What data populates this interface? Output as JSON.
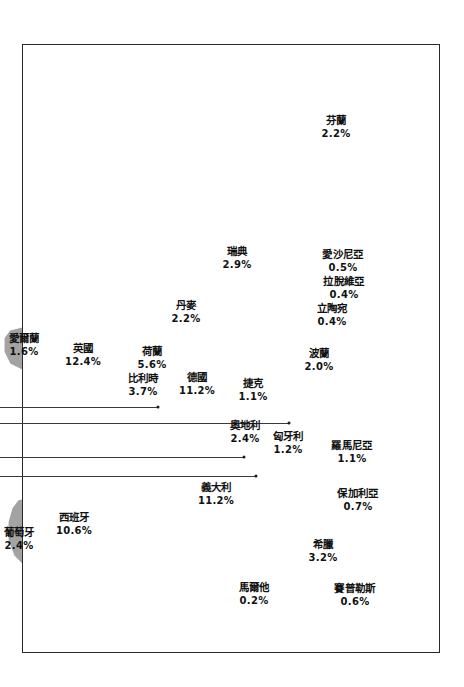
{
  "figure": {
    "type": "choropleth-map",
    "region": "Europe",
    "land_color": "#a3a3a3",
    "border_color": "#ffffff",
    "sea_color": "#ffffff",
    "frame_color": "#2a2a2a",
    "label_color": "#111111",
    "leader_color": "#3a3a3a"
  },
  "chart_data": {
    "type": "map",
    "title": "",
    "subtitle": "",
    "xlabel": "",
    "ylabel": "",
    "unit": "%",
    "legend": [],
    "grid": false,
    "categories": [
      "芬蘭",
      "瑞典",
      "丹麥",
      "愛沙尼亞",
      "拉脫維亞",
      "立陶宛",
      "愛爾蘭",
      "英國",
      "荷蘭",
      "比利時",
      "德國",
      "波蘭",
      "捷克",
      "奧地利",
      "匈牙利",
      "羅馬尼亞",
      "義大利",
      "保加利亞",
      "西班牙",
      "葡萄牙",
      "希臘",
      "馬爾他",
      "賽普勒斯"
    ],
    "values": [
      2.2,
      2.9,
      2.2,
      0.5,
      0.4,
      0.4,
      1.6,
      12.4,
      5.6,
      3.7,
      11.2,
      2.0,
      1.1,
      2.4,
      1.2,
      1.1,
      11.2,
      0.7,
      10.6,
      2.4,
      3.2,
      0.2,
      0.6
    ]
  },
  "labels": [
    {
      "name": "芬蘭",
      "value": "2.2%",
      "key": "finland",
      "x": 336,
      "y": 127
    },
    {
      "name": "瑞典",
      "value": "2.9%",
      "key": "sweden",
      "x": 237,
      "y": 258
    },
    {
      "name": "丹麥",
      "value": "2.2%",
      "key": "denmark",
      "x": 186,
      "y": 312
    },
    {
      "name": "愛沙尼亞",
      "value": "0.5%",
      "key": "estonia",
      "x": 343,
      "y": 261
    },
    {
      "name": "拉脫維亞",
      "value": "0.4%",
      "key": "latvia",
      "x": 344,
      "y": 288
    },
    {
      "name": "立陶宛",
      "value": "0.4%",
      "key": "lithuania",
      "x": 332,
      "y": 315
    },
    {
      "name": "愛爾蘭",
      "value": "1.6%",
      "key": "ireland",
      "x": 24,
      "y": 345
    },
    {
      "name": "英國",
      "value": "12.4%",
      "key": "united-kingdom",
      "x": 83,
      "y": 355
    },
    {
      "name": "荷蘭",
      "value": "5.6%",
      "key": "netherlands",
      "x": 152,
      "y": 358
    },
    {
      "name": "比利時",
      "value": "3.7%",
      "key": "belgium",
      "x": 143,
      "y": 385
    },
    {
      "name": "德國",
      "value": "11.2%",
      "key": "germany",
      "x": 197,
      "y": 384
    },
    {
      "name": "波蘭",
      "value": "2.0%",
      "key": "poland",
      "x": 319,
      "y": 360
    },
    {
      "name": "捷克",
      "value": "1.1%",
      "key": "czechia",
      "x": 253,
      "y": 390
    },
    {
      "name": "奧地利",
      "value": "2.4%",
      "key": "austria",
      "x": 245,
      "y": 432
    },
    {
      "name": "匈牙利",
      "value": "1.2%",
      "key": "hungary",
      "x": 288,
      "y": 443
    },
    {
      "name": "羅馬尼亞",
      "value": "1.1%",
      "key": "romania",
      "x": 352,
      "y": 452
    },
    {
      "name": "義大利",
      "value": "11.2%",
      "key": "italy",
      "x": 216,
      "y": 494
    },
    {
      "name": "保加利亞",
      "value": "0.7%",
      "key": "bulgaria",
      "x": 358,
      "y": 500
    },
    {
      "name": "西班牙",
      "value": "10.6%",
      "key": "spain",
      "x": 74,
      "y": 524
    },
    {
      "name": "葡萄牙",
      "value": "2.4%",
      "key": "portugal",
      "x": 19,
      "y": 539
    },
    {
      "name": "希臘",
      "value": "3.2%",
      "key": "greece",
      "x": 323,
      "y": 551
    },
    {
      "name": "馬爾他",
      "value": "0.2%",
      "key": "malta",
      "x": 254,
      "y": 594
    },
    {
      "name": "賽普勒斯",
      "value": "0.6%",
      "key": "cyprus",
      "x": 355,
      "y": 595
    }
  ],
  "leaders": [
    {
      "key": "leader-1",
      "x1": 0,
      "y1": 407,
      "x2": 158,
      "y2": 407
    },
    {
      "key": "leader-2",
      "x1": 0,
      "y1": 423,
      "x2": 289,
      "y2": 423
    },
    {
      "key": "leader-3",
      "x1": 0,
      "y1": 457,
      "x2": 244,
      "y2": 457
    },
    {
      "key": "leader-4",
      "x1": 0,
      "y1": 476,
      "x2": 256,
      "y2": 476
    }
  ]
}
